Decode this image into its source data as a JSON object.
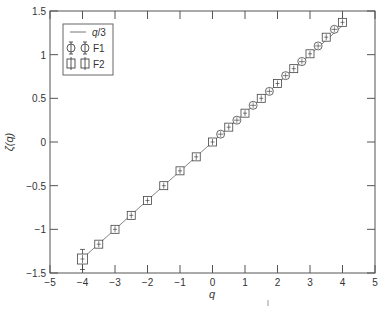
{
  "chart_data": {
    "type": "scatter",
    "title": "",
    "xlabel": "q",
    "ylabel": "ζ(q)",
    "xlim": [
      -5,
      5
    ],
    "ylim": [
      -1.5,
      1.5
    ],
    "xticks": [
      -5,
      -4,
      -3,
      -2,
      -1,
      0,
      1,
      2,
      3,
      4,
      5
    ],
    "xtick_labels": [
      "−5",
      "−4",
      "−3",
      "−2",
      "−1",
      "0",
      "1",
      "2",
      "3",
      "4",
      "5"
    ],
    "yticks": [
      -1.5,
      -1,
      -0.5,
      0,
      0.5,
      1,
      1.5
    ],
    "ytick_labels": [
      "−1.5",
      "−1",
      "−0.5",
      "0",
      "0.5",
      "1",
      "1.5"
    ],
    "grid": false,
    "legend_position": "upper left",
    "series": [
      {
        "name": "q/3",
        "kind": "line",
        "x": [
          -4,
          4
        ],
        "y": [
          -1.333,
          1.333
        ]
      },
      {
        "name": "F1",
        "kind": "marker-circle-errorbar",
        "x": [
          -4,
          -3.5,
          -3,
          -2.5,
          -2,
          -1.5,
          -1,
          -0.5,
          0,
          0.25,
          0.75,
          1.25,
          1.75,
          2.25,
          2.75,
          3.25,
          3.75
        ],
        "y": [
          -1.33,
          -1.17,
          -1.0,
          -0.83,
          -0.67,
          -0.5,
          -0.33,
          -0.17,
          0.0,
          0.09,
          0.25,
          0.42,
          0.58,
          0.76,
          0.92,
          1.1,
          1.29
        ]
      },
      {
        "name": "F2",
        "kind": "marker-square-errorbar",
        "x": [
          -4,
          -3.5,
          -3,
          -2.5,
          -2,
          -1.5,
          -1,
          -0.5,
          0,
          0.5,
          1,
          1.5,
          2,
          2.5,
          3,
          3.5,
          4
        ],
        "y": [
          -1.34,
          -1.17,
          -1.0,
          -0.84,
          -0.67,
          -0.5,
          -0.33,
          -0.17,
          0.0,
          0.17,
          0.33,
          0.5,
          0.67,
          0.84,
          1.01,
          1.2,
          1.37
        ],
        "yerr_low": [
          0.12,
          0.03,
          0.02,
          0.02,
          0.02,
          0.01,
          0.01,
          0.01,
          0.01,
          0.01,
          0.01,
          0.01,
          0.01,
          0.01,
          0.02,
          0.02,
          0.03
        ],
        "yerr_high": [
          0.11,
          0.03,
          0.02,
          0.02,
          0.02,
          0.01,
          0.01,
          0.01,
          0.01,
          0.01,
          0.01,
          0.01,
          0.01,
          0.01,
          0.02,
          0.02,
          0.03
        ]
      }
    ]
  },
  "legend": {
    "items": [
      {
        "label": "q/3",
        "italic_part": "q",
        "rest": "/3"
      },
      {
        "label": "F1"
      },
      {
        "label": "F2"
      }
    ]
  },
  "colors": {
    "axis": "#555555",
    "line": "#777777",
    "marker": "#444444",
    "background": "#ffffff"
  }
}
